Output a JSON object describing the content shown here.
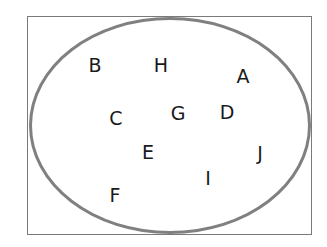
{
  "diagram": {
    "type": "venn",
    "universe_box": true,
    "set_stroke_color": "#808080",
    "elements": [
      {
        "label": "B",
        "x": 95,
        "y": 65
      },
      {
        "label": "H",
        "x": 161,
        "y": 65
      },
      {
        "label": "A",
        "x": 243,
        "y": 76
      },
      {
        "label": "C",
        "x": 116,
        "y": 118
      },
      {
        "label": "G",
        "x": 178,
        "y": 113
      },
      {
        "label": "D",
        "x": 227,
        "y": 112
      },
      {
        "label": "E",
        "x": 148,
        "y": 152
      },
      {
        "label": "J",
        "x": 260,
        "y": 153
      },
      {
        "label": "I",
        "x": 208,
        "y": 178
      },
      {
        "label": "F",
        "x": 115,
        "y": 195
      }
    ]
  }
}
